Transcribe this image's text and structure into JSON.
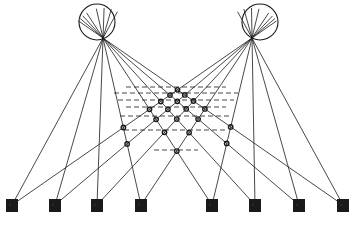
{
  "diagram": {
    "type": "binocular-correspondence-lattice",
    "colors": {
      "ink": "#1a1a1a",
      "background": "#ffffff"
    },
    "eyes": [
      {
        "name": "left-eye",
        "cx": 97,
        "cy": 22,
        "r": 18
      },
      {
        "name": "right-eye",
        "cx": 260,
        "cy": 22,
        "r": 18
      }
    ],
    "nodal_points": {
      "left": [
        103,
        38
      ],
      "right": [
        252,
        38
      ]
    },
    "targets": [
      {
        "id": "t1",
        "x": 12,
        "glyph": "·"
      },
      {
        "id": "t2",
        "x": 55,
        "glyph": "·"
      },
      {
        "id": "t3",
        "x": 97,
        "glyph": "·"
      },
      {
        "id": "t4",
        "x": 141,
        "glyph": "·"
      },
      {
        "id": "t5",
        "x": 212,
        "glyph": "·"
      },
      {
        "id": "t6",
        "x": 255,
        "glyph": "·"
      },
      {
        "id": "t7",
        "x": 299,
        "glyph": "·"
      },
      {
        "id": "t8",
        "x": 343,
        "glyph": "·"
      }
    ],
    "target_y": 205,
    "lattice": {
      "apex": [
        176,
        88
      ],
      "bottom": [
        176,
        150
      ],
      "dashed_rows_y": [
        87,
        93,
        100,
        107,
        116,
        130,
        150
      ]
    }
  }
}
